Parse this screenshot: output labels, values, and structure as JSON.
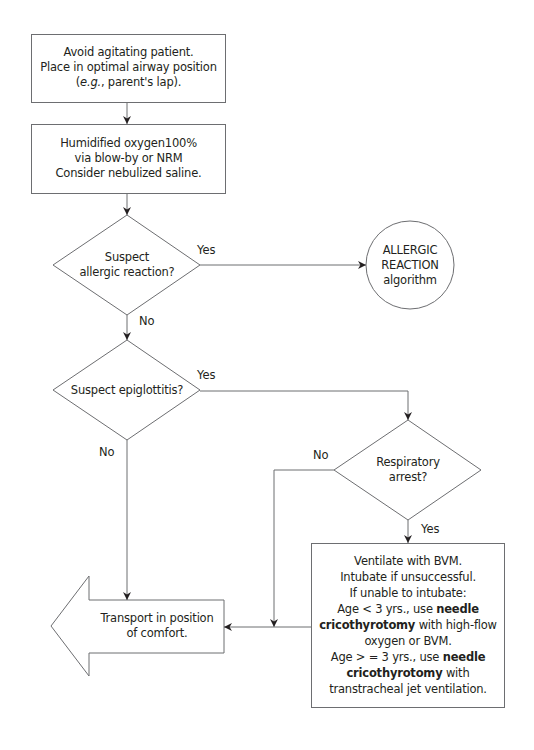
{
  "flowchart": {
    "nodes": {
      "box1": {
        "shape": "rectangle",
        "lines": [
          "Avoid agitating patient.",
          "Place in optimal airway position",
          "(e.g., parent's lap)."
        ],
        "line3_italic": "e.g.",
        "line3_rest": ", parent's lap).",
        "line3_open": "("
      },
      "box2": {
        "shape": "rectangle",
        "lines": [
          "Humidified oxygen100%",
          "via blow-by or NRM",
          "Consider nebulized saline."
        ]
      },
      "decision_allergic": {
        "shape": "diamond",
        "lines": [
          "Suspect",
          "allergic reaction?"
        ],
        "yes_label": "Yes",
        "no_label": "No"
      },
      "allergic_algorithm": {
        "shape": "circle",
        "lines": [
          "ALLERGIC",
          "REACTION",
          "algorithm"
        ]
      },
      "decision_epiglottitis": {
        "shape": "diamond",
        "lines": [
          "Suspect epiglottitis?"
        ],
        "yes_label": "Yes",
        "no_label": "No"
      },
      "decision_respiratory": {
        "shape": "diamond",
        "lines": [
          "Respiratory",
          "arrest?"
        ],
        "yes_label": "Yes",
        "no_label": "No"
      },
      "box_ventilate": {
        "shape": "rectangle",
        "line1": "Ventilate with BVM.",
        "line2": "Intubate if unsuccessful.",
        "line3": "If unable to intubate:",
        "line4_a": "Age < 3 yrs., use ",
        "line4_b": "needle",
        "line5_a": "cricothyrotomy",
        "line5_b": " with high-flow",
        "line6": "oxygen or BVM.",
        "line7_a": "Age > = 3 yrs., use ",
        "line7_b": "needle",
        "line8_a": "cricothyrotomy",
        "line8_b": " with",
        "line9": "transtracheal jet ventilation."
      },
      "transport": {
        "shape": "left-arrow",
        "lines": [
          "Transport in position",
          "of comfort."
        ]
      }
    },
    "colors": {
      "stroke": "#6d6e71",
      "text": "#231f20",
      "background": "#ffffff"
    }
  }
}
